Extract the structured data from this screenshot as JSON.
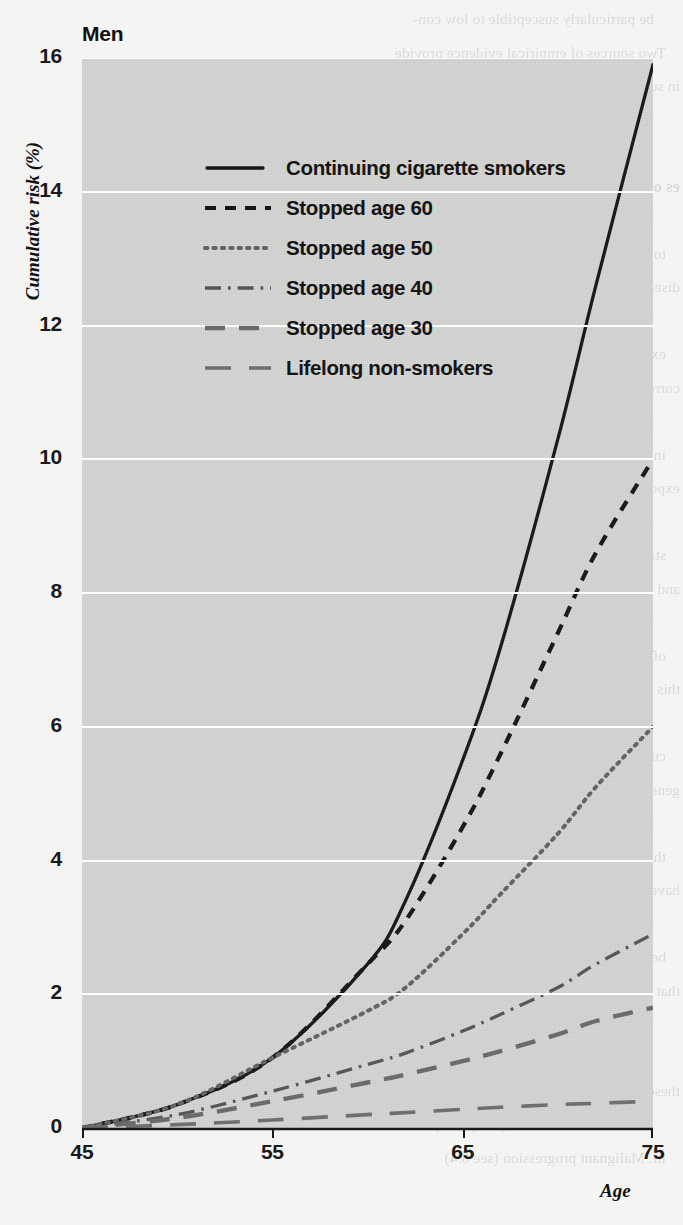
{
  "title": "Men",
  "axis": {
    "ylabel": "Cumulative risk (%)",
    "xlabel": "Age",
    "yticks": [
      "0",
      "2",
      "4",
      "6",
      "8",
      "10",
      "12",
      "14",
      "16"
    ],
    "xticks": [
      "45",
      "55",
      "65",
      "75"
    ]
  },
  "legend": {
    "items": [
      {
        "label": "Continuing cigarette smokers",
        "style": "solid"
      },
      {
        "label": "Stopped age 60",
        "style": "dashed"
      },
      {
        "label": "Stopped age 50",
        "style": "dotted"
      },
      {
        "label": "Stopped age 40",
        "style": "dash-dot"
      },
      {
        "label": "Stopped age 30",
        "style": "long-dash-dark"
      },
      {
        "label": "Lifelong non-smokers",
        "style": "long-dash"
      }
    ]
  },
  "colors": {
    "panel": "#d5d5d4",
    "gridline": "#fdfdfd",
    "ink": "#1a1a1a",
    "ink_soft": "#5a5a5a",
    "page": "#f4f4f3"
  },
  "chart_data": {
    "type": "line",
    "title": "Men",
    "xlabel": "Age",
    "ylabel": "Cumulative risk (%)",
    "xlim": [
      45,
      75
    ],
    "ylim": [
      0,
      16
    ],
    "xticks": [
      45,
      55,
      65,
      75
    ],
    "yticks": [
      0,
      2,
      4,
      6,
      8,
      10,
      12,
      14,
      16
    ],
    "grid": "horizontal-white",
    "legend_position": "top-left-inside",
    "x": [
      45,
      50,
      55,
      60,
      62,
      65,
      67,
      70,
      72,
      75
    ],
    "series": [
      {
        "name": "Continuing cigarette smokers",
        "style": "solid",
        "values": [
          0,
          0.35,
          1.05,
          2.45,
          3.4,
          5.5,
          7.2,
          10.3,
          12.6,
          15.9
        ]
      },
      {
        "name": "Stopped age 60",
        "style": "dashed",
        "values": [
          0,
          0.35,
          1.05,
          2.45,
          3.1,
          4.5,
          5.6,
          7.4,
          8.6,
          10.0
        ]
      },
      {
        "name": "Stopped age 50",
        "style": "dotted",
        "values": [
          0,
          0.35,
          1.05,
          1.75,
          2.1,
          2.9,
          3.5,
          4.4,
          5.1,
          6.0
        ]
      },
      {
        "name": "Stopped age 40",
        "style": "dash-dot",
        "values": [
          0,
          0.2,
          0.55,
          0.95,
          1.12,
          1.45,
          1.7,
          2.1,
          2.45,
          2.9
        ]
      },
      {
        "name": "Stopped age 30",
        "style": "long-dash-dark",
        "values": [
          0,
          0.15,
          0.4,
          0.68,
          0.8,
          1.0,
          1.15,
          1.4,
          1.6,
          1.8
        ]
      },
      {
        "name": "Lifelong non-smokers",
        "style": "long-dash",
        "values": [
          0,
          0.05,
          0.12,
          0.2,
          0.23,
          0.28,
          0.31,
          0.35,
          0.37,
          0.4
        ]
      }
    ]
  },
  "bleed_text": {
    "lines": [
      "be particularly susceptible to low con-",
      "Two sources of empirical evidence provide",
      "in support of this conclusion. First, the",
      "this effect are not consistent with a thresh-",
      "",
      "es of Cancer",
      "These results, which are summarized and are",
      "to many individuals, may be particularly relevant",
      "disease that later workers may appear long after",
      "from the studies of workers exposed to asbestos",
      "example the mesothelioma was caused by low levels",
      "correspond to those of the normal population in city",
      "survey years — some persons for up to 20 years after exp",
      "indicated that these effects occurred at doses not well",
      "exposure levels, but more so after exposure to the carcino-",
      "tissue damage. This observation is the fact that this cate-",
      "stands out clearly from in some countries, measures are",
      "and regulations on exposure to the very smoking continues",
      "to be a key factor. Also, for individuals with a dramatic",
      "of the mechanisms have been reported to occur in",
      "this is even the case, the compilation of cancers in relation",
      "to occupational exposure given in unit has been done for beyond",
      "current workplaces. These are also defined in terms of a",
      "general character in the incidence of tumours associated",
      "industry are detailed in discussions for that chapter",
      "that are later in the current history. This has been used to",
      "have in some instances to provide an estimate for many",
      "disease. Data from different aetiological situations can",
      "be strongly linked between the risk period of",
      "that there is usually not to give an estimation of clear",
      "these sometimes occur lower and the types of",
      "",
      "these represent more directly applicable to",
      "asbestos fibre in China (Chapter 1) and",
      "iii. Malignant progression (see 6.4)"
    ]
  }
}
